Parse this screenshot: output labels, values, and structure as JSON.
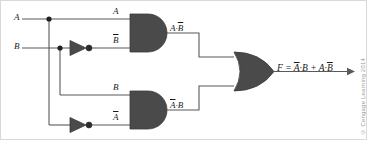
{
  "diagram": {
    "inputs": [
      {
        "id": "input-a",
        "label": "A"
      },
      {
        "id": "input-b",
        "label": "B"
      }
    ],
    "signal_labels": [
      {
        "id": "wire-label-a",
        "text": "A",
        "overline": false
      },
      {
        "id": "wire-label-b-bar",
        "text": "B",
        "overline": true
      },
      {
        "id": "wire-label-b",
        "text": "B",
        "overline": false
      },
      {
        "id": "wire-label-a-bar",
        "text": "A",
        "overline": true
      }
    ],
    "gates": [
      {
        "id": "and-gate-top",
        "type": "AND",
        "output_label_plain": "A·B",
        "output_label_html": "A·<span class=\"ovl\">B</span>"
      },
      {
        "id": "and-gate-bottom",
        "type": "AND",
        "output_label_plain": "A·B",
        "output_label_html": "<span class=\"ovl\">A</span>·B"
      },
      {
        "id": "or-gate",
        "type": "OR",
        "output_label_plain": "F"
      },
      {
        "id": "inverter-b",
        "type": "NOT",
        "input": "B",
        "output": "B̅"
      },
      {
        "id": "inverter-a",
        "type": "NOT",
        "input": "A",
        "output": "A̅"
      }
    ],
    "output": {
      "id": "output-expression",
      "text": "F = A̅·B + A·B̅",
      "prefix": "F = ",
      "term1_bar": "A",
      "term1_rest": "·B",
      "operator": " + ",
      "term2_plain": "A·",
      "term2_bar": "B"
    },
    "credit": "© Cengage Learning 2014",
    "colors": {
      "gate_fill": "#4a4a4a",
      "wire": "#595959",
      "text": "#1a1a1a",
      "credit": "#9a9a9a",
      "frame": "#d9d9d9",
      "background": "#ffffff"
    }
  }
}
